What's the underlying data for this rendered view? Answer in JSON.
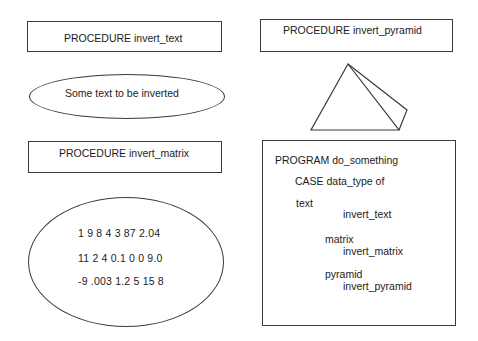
{
  "diagram": {
    "procedures": {
      "invert_text": {
        "label": "PROCEDURE invert_text",
        "sample": "Some text to be inverted"
      },
      "invert_matrix": {
        "label": "PROCEDURE invert_matrix",
        "rows": [
          "1 9 8 4 3 87 2.04",
          "11 2 4 0.1 0 0 9.0",
          "-9 .003 1.2 5 15 8"
        ]
      },
      "invert_pyramid": {
        "label": "PROCEDURE invert_pyramid",
        "shape": "pyramid-icon"
      }
    },
    "program": {
      "title": "PROGRAM do_something",
      "case_line": "CASE data_type of",
      "cases": [
        {
          "type": "text",
          "call": "invert_text"
        },
        {
          "type": "matrix",
          "call": "invert_matrix"
        },
        {
          "type": "pyramid",
          "call": "invert_pyramid"
        }
      ]
    },
    "colors": {
      "stroke": "#3a3a3a",
      "text": "#1c1c1c",
      "background": "#ffffff"
    }
  }
}
